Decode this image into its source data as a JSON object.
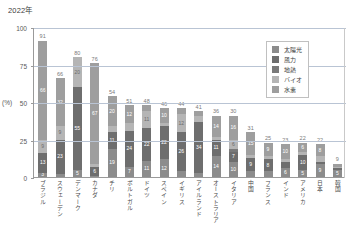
{
  "chart_data": {
    "type": "bar",
    "title": "2022年",
    "xlabel": "",
    "ylabel": "(%)",
    "ylim": [
      0,
      100
    ],
    "yticks": [
      0,
      25,
      50,
      75,
      100
    ],
    "grid": true,
    "stacked": true,
    "legend_position": "top-right",
    "categories": [
      "ブラジル",
      "スウェーデン",
      "デンマーク",
      "カナダ",
      "チリ",
      "ポルトガル",
      "ドイツ",
      "スペイン",
      "イギリス",
      "アイルランド",
      "オーストラリア",
      "イタリア",
      "中国",
      "フランス",
      "インド",
      "アメリカ",
      "日本",
      "韓国"
    ],
    "series": [
      {
        "name": "太陽光",
        "color": "#8c8c8c",
        "values": [
          3,
          2,
          5,
          1,
          19,
          7,
          11,
          12,
          4,
          3,
          14,
          10,
          4,
          4,
          6,
          5,
          9,
          5
        ]
      },
      {
        "name": "風力",
        "color": "#6e6e6e",
        "values": [
          13,
          23,
          55,
          6,
          11,
          24,
          22,
          22,
          26,
          34,
          11,
          7,
          9,
          8,
          4,
          10,
          1,
          1
        ]
      },
      {
        "name": "地熱",
        "color": "#7a7a7a",
        "values": [
          0,
          0,
          0,
          0,
          0,
          0,
          0,
          0,
          0,
          0,
          0,
          2,
          0,
          0,
          0,
          0,
          0,
          0
        ]
      },
      {
        "name": "バイオ",
        "color": "#b5b5b5",
        "values": [
          9,
          9,
          20,
          2,
          4,
          5,
          11,
          2,
          12,
          4,
          2,
          6,
          2,
          2,
          2,
          2,
          4,
          1
        ]
      },
      {
        "name": "水素",
        "color": "#9e9e9e",
        "values": [
          66,
          32,
          0,
          67,
          20,
          12,
          4,
          10,
          4,
          3,
          14,
          16,
          15,
          9,
          10,
          6,
          8,
          2
        ]
      }
    ],
    "totals": [
      91,
      66,
      80,
      76,
      54,
      51,
      48,
      46,
      44,
      41,
      36,
      30,
      31,
      25,
      23,
      22,
      22,
      9
    ],
    "segment_labels": [
      [
        "3",
        "13",
        "",
        "9",
        "66"
      ],
      [
        "",
        "23",
        "",
        "9",
        "32"
      ],
      [
        "5",
        "55",
        "",
        "20",
        ""
      ],
      [
        "",
        "6",
        "",
        "",
        "67"
      ],
      [
        "19",
        "11",
        "",
        "",
        "20"
      ],
      [
        "7",
        "24",
        "",
        "",
        "12"
      ],
      [
        "11",
        "22",
        "",
        "11",
        ""
      ],
      [
        "12",
        "22",
        "",
        "",
        "10"
      ],
      [
        "",
        "26",
        "",
        "12",
        ""
      ],
      [
        "",
        "34",
        "",
        "",
        ""
      ],
      [
        "14",
        "11",
        "",
        "",
        "14"
      ],
      [
        "10",
        "7",
        "",
        "6",
        "16"
      ],
      [
        "",
        "9",
        "",
        "",
        "15"
      ],
      [
        "",
        "8",
        "",
        "",
        "9"
      ],
      [
        "6",
        "",
        "",
        "",
        "10"
      ],
      [
        "5",
        "10",
        "",
        "",
        "6"
      ],
      [
        "9",
        "",
        "",
        "",
        "8"
      ],
      [
        "5",
        "",
        "",
        "",
        ""
      ]
    ]
  },
  "legend": {
    "items": [
      {
        "label": "太陽光",
        "color": "#8c8c8c"
      },
      {
        "label": "風力",
        "color": "#6e6e6e"
      },
      {
        "label": "地熱",
        "color": "#7a7a7a"
      },
      {
        "label": "バイオ",
        "color": "#b5b5b5"
      },
      {
        "label": "水素",
        "color": "#9e9e9e"
      }
    ]
  },
  "axis": {
    "unit_label": "(%)",
    "tick_labels": [
      "100",
      "75",
      "50",
      "25",
      "0"
    ]
  }
}
